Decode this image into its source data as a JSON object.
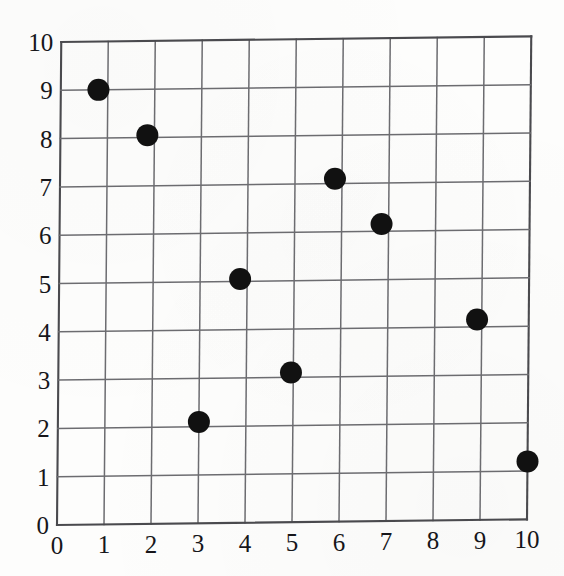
{
  "chart_data": {
    "type": "scatter",
    "title": "",
    "subtitle": "",
    "xlabel": "",
    "ylabel": "",
    "xlim": [
      0,
      10
    ],
    "ylim": [
      0,
      10
    ],
    "grid": true,
    "legend": null,
    "legend_position": "none",
    "marker": {
      "shape": "circle",
      "color": "#111111",
      "diameter_px": 22
    },
    "x_ticks": [
      "0",
      "1",
      "2",
      "3",
      "4",
      "5",
      "6",
      "7",
      "8",
      "9",
      "10"
    ],
    "y_ticks": [
      "0",
      "1",
      "2",
      "3",
      "4",
      "5",
      "6",
      "7",
      "8",
      "9",
      "10"
    ],
    "points": [
      {
        "x": 0.8,
        "y": 9.0
      },
      {
        "x": 1.85,
        "y": 8.05
      },
      {
        "x": 3.0,
        "y": 2.1
      },
      {
        "x": 3.85,
        "y": 5.05
      },
      {
        "x": 4.95,
        "y": 3.1
      },
      {
        "x": 5.85,
        "y": 7.1
      },
      {
        "x": 6.85,
        "y": 6.15
      },
      {
        "x": 8.9,
        "y": 4.15
      },
      {
        "x": 10.0,
        "y": 1.2
      }
    ]
  },
  "style": {
    "background_color": "#fdfdfc",
    "grid_color": "#6c6c70",
    "axis_color": "#4a4a4e",
    "label_color": "#16161a",
    "marker_color": "#111111"
  }
}
